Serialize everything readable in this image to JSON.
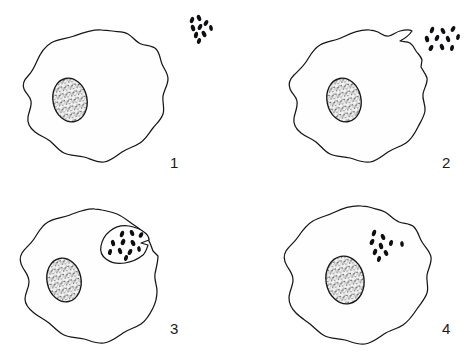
{
  "figure": {
    "background_color": "#ffffff",
    "ink_color": "#15151c",
    "bacteria_color": "#0d0d12",
    "nucleus_fill": "#d8d8d8",
    "width": 472,
    "height": 360
  },
  "panels": [
    {
      "id": "panel-1",
      "number": "1",
      "number_x": 170,
      "number_y": 168,
      "caption": "",
      "cell": {
        "name": "phagocyte-cell",
        "nucleus": {
          "cx": 70,
          "cy": 100,
          "rx": 17,
          "ry": 22,
          "rotate": -12
        }
      },
      "bacteria_group": {
        "name": "bacteria-cluster-outside",
        "count": 9,
        "location": "outside-upper-right"
      }
    },
    {
      "id": "panel-2",
      "number": "2",
      "number_x": 442,
      "number_y": 168,
      "caption": "",
      "cell": {
        "name": "phagocyte-cell",
        "nucleus": {
          "cx": 344,
          "cy": 100,
          "rx": 17,
          "ry": 22,
          "rotate": -12
        }
      },
      "bacteria_group": {
        "name": "bacteria-cluster-at-membrane",
        "count": 10,
        "location": "membrane-notch-upper-right"
      }
    },
    {
      "id": "panel-3",
      "number": "3",
      "number_x": 170,
      "number_y": 334,
      "caption": "",
      "cell": {
        "name": "phagocyte-cell",
        "nucleus": {
          "cx": 64,
          "cy": 280,
          "rx": 17,
          "ry": 22,
          "rotate": -12
        }
      },
      "bacteria_group": {
        "name": "bacteria-cluster-engulfed-pocket",
        "count": 11,
        "location": "forming-phagosome-pocket"
      }
    },
    {
      "id": "panel-4",
      "number": "4",
      "number_x": 442,
      "number_y": 334,
      "caption": "",
      "cell": {
        "name": "phagocyte-cell",
        "nucleus": {
          "cx": 345,
          "cy": 280,
          "rx": 19,
          "ry": 24,
          "rotate": -10
        }
      },
      "bacteria_group": {
        "name": "bacteria-cluster-internalized",
        "count": 9,
        "location": "inside-cytoplasm"
      }
    }
  ]
}
